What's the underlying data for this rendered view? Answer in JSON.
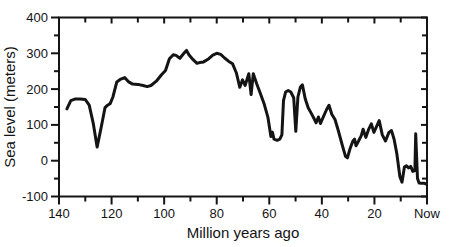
{
  "figure": {
    "background": "#ffffff",
    "ink": "#141414",
    "curve_width": 3,
    "axis_width": 2
  },
  "chart_data": {
    "type": "line",
    "title": "",
    "xlabel": "Million years ago",
    "ylabel": "Sea level (meters)",
    "xlim": [
      140,
      0
    ],
    "ylim": [
      -100,
      400
    ],
    "x_axis_reversed": true,
    "grid": false,
    "legend": "none",
    "x_major_ticks": [
      140,
      120,
      100,
      80,
      60,
      40,
      20,
      0
    ],
    "x_tick_labels": [
      "140",
      "120",
      "100",
      "80",
      "60",
      "40",
      "20",
      "Now"
    ],
    "x_minor_ticks": [
      130,
      110,
      90,
      70,
      50,
      30,
      10
    ],
    "y_major_ticks": [
      -100,
      0,
      100,
      200,
      300,
      400
    ],
    "y_tick_labels": [
      "-100",
      "0",
      "100",
      "200",
      "300",
      "400"
    ],
    "y_minor_ticks": [
      -50,
      50,
      150,
      250,
      350
    ],
    "series": [
      {
        "name": "sea-level",
        "points": [
          [
            137,
            145
          ],
          [
            135.5,
            168
          ],
          [
            134,
            172
          ],
          [
            132,
            172
          ],
          [
            130,
            171
          ],
          [
            128.5,
            155
          ],
          [
            127,
            105
          ],
          [
            125.5,
            38
          ],
          [
            124,
            92
          ],
          [
            122.5,
            148
          ],
          [
            121.5,
            155
          ],
          [
            120.5,
            160
          ],
          [
            119.5,
            178
          ],
          [
            118,
            220
          ],
          [
            116.5,
            228
          ],
          [
            115,
            232
          ],
          [
            113.5,
            220
          ],
          [
            112,
            214
          ],
          [
            110,
            213
          ],
          [
            108,
            210
          ],
          [
            106.5,
            207
          ],
          [
            105,
            210
          ],
          [
            103,
            222
          ],
          [
            101,
            240
          ],
          [
            99.5,
            252
          ],
          [
            98,
            285
          ],
          [
            96.5,
            296
          ],
          [
            95.5,
            294
          ],
          [
            94,
            286
          ],
          [
            92.5,
            300
          ],
          [
            91.5,
            308
          ],
          [
            90.5,
            295
          ],
          [
            89,
            282
          ],
          [
            87.5,
            272
          ],
          [
            86.5,
            274
          ],
          [
            85,
            276
          ],
          [
            83,
            285
          ],
          [
            81.5,
            295
          ],
          [
            80,
            300
          ],
          [
            78.5,
            297
          ],
          [
            77,
            287
          ],
          [
            75.5,
            278
          ],
          [
            74,
            271
          ],
          [
            72.5,
            245
          ],
          [
            71.2,
            205
          ],
          [
            70.2,
            226
          ],
          [
            69.2,
            210
          ],
          [
            67.8,
            243
          ],
          [
            66.9,
            185
          ],
          [
            66.1,
            243
          ],
          [
            64.8,
            215
          ],
          [
            63.5,
            190
          ],
          [
            62,
            160
          ],
          [
            60.5,
            120
          ],
          [
            59.4,
            68
          ],
          [
            58.8,
            80
          ],
          [
            58.2,
            60
          ],
          [
            57,
            57
          ],
          [
            56,
            60
          ],
          [
            55.2,
            72
          ],
          [
            54.6,
            168
          ],
          [
            53.8,
            192
          ],
          [
            52.8,
            196
          ],
          [
            51.8,
            192
          ],
          [
            50.7,
            176
          ],
          [
            49.9,
            82
          ],
          [
            49.1,
            178
          ],
          [
            48.2,
            205
          ],
          [
            47.4,
            212
          ],
          [
            46.3,
            172
          ],
          [
            45.2,
            148
          ],
          [
            44,
            132
          ],
          [
            42.8,
            115
          ],
          [
            42.2,
            106
          ],
          [
            41.3,
            122
          ],
          [
            40.5,
            104
          ],
          [
            39.3,
            125
          ],
          [
            38.2,
            143
          ],
          [
            37.3,
            155
          ],
          [
            36.2,
            130
          ],
          [
            35,
            115
          ],
          [
            33.8,
            85
          ],
          [
            32.2,
            42
          ],
          [
            31,
            12
          ],
          [
            30.3,
            8
          ],
          [
            29.2,
            35
          ],
          [
            28.2,
            55
          ],
          [
            27.6,
            60
          ],
          [
            27,
            42
          ],
          [
            26,
            56
          ],
          [
            25,
            70
          ],
          [
            24.3,
            88
          ],
          [
            23.3,
            65
          ],
          [
            22.3,
            86
          ],
          [
            21.2,
            103
          ],
          [
            20.2,
            79
          ],
          [
            19.2,
            95
          ],
          [
            18.2,
            112
          ],
          [
            17,
            72
          ],
          [
            15.8,
            55
          ],
          [
            14.5,
            79
          ],
          [
            13.5,
            84
          ],
          [
            12.5,
            60
          ],
          [
            11.5,
            20
          ],
          [
            10.3,
            -45
          ],
          [
            9.5,
            -60
          ],
          [
            8.6,
            -18
          ],
          [
            7.8,
            -14
          ],
          [
            7,
            -20
          ],
          [
            6.2,
            -16
          ],
          [
            5.4,
            -30
          ],
          [
            4.6,
            -28
          ],
          [
            4.3,
            75
          ],
          [
            3.6,
            -50
          ],
          [
            3,
            -62
          ],
          [
            2,
            -63
          ],
          [
            1,
            -63
          ],
          [
            0.3,
            -65
          ]
        ]
      }
    ]
  }
}
